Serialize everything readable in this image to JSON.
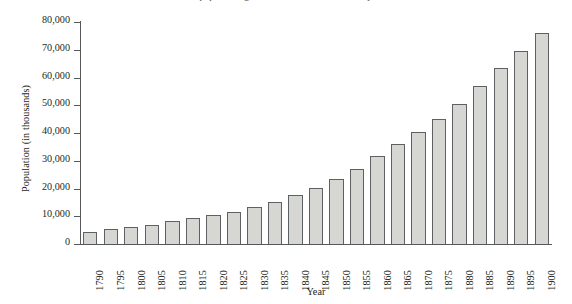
{
  "figure": {
    "clipped_caption": "population growth in the nineteenth century"
  },
  "chart_data": {
    "type": "bar",
    "title": "",
    "xlabel": "Year",
    "ylabel": "Population (in thousands)",
    "ylim": [
      0,
      80000
    ],
    "ytick_step": 10000,
    "grid": false,
    "legend": "none",
    "bar_fill_color": "#d6d6d3",
    "bar_border_color": "#5e6163",
    "axis_color": "#55595c",
    "ytick_labels": [
      "0",
      "10,000",
      "20,000",
      "30,000",
      "40,000",
      "50,000",
      "60,000",
      "70,000",
      "80,000"
    ],
    "ytick_values": [
      0,
      10000,
      20000,
      30000,
      40000,
      50000,
      60000,
      70000,
      80000
    ],
    "categories": [
      "1790",
      "1795",
      "1800",
      "1805",
      "1810",
      "1815",
      "1820",
      "1825",
      "1830",
      "1835",
      "1840",
      "1845",
      "1850",
      "1855",
      "1860",
      "1865",
      "1870",
      "1875",
      "1880",
      "1885",
      "1890",
      "1895",
      "1900"
    ],
    "values": [
      4300,
      5300,
      6100,
      6900,
      8200,
      9200,
      10500,
      11500,
      13300,
      15200,
      17800,
      20200,
      23500,
      27200,
      31800,
      36000,
      40500,
      45200,
      50500,
      57000,
      63500,
      69500,
      76000
    ]
  }
}
